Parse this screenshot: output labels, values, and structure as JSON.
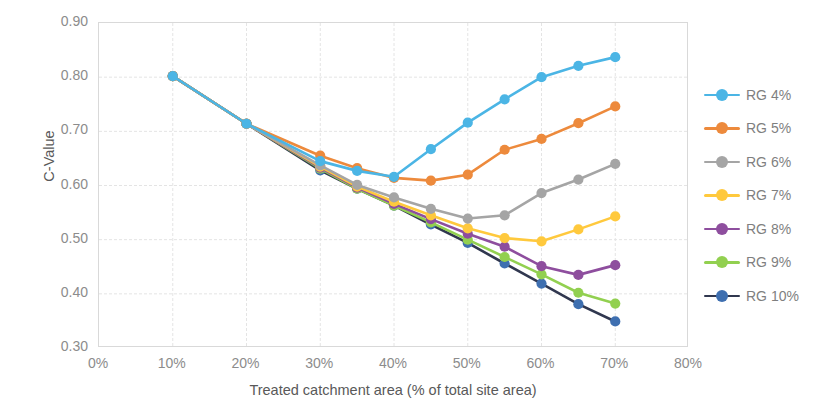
{
  "chart_data": {
    "type": "line",
    "title": "",
    "xlabel": "Treated catchment area (% of total site area)",
    "ylabel": "C-Value",
    "xlim": [
      0,
      80
    ],
    "ylim": [
      0.3,
      0.9
    ],
    "x_ticks": [
      "0%",
      "10%",
      "20%",
      "30%",
      "40%",
      "50%",
      "60%",
      "70%",
      "80%"
    ],
    "x_tick_values": [
      0,
      10,
      20,
      30,
      40,
      50,
      60,
      70,
      80
    ],
    "y_ticks": [
      "0.30",
      "0.40",
      "0.50",
      "0.60",
      "0.70",
      "0.80",
      "0.90"
    ],
    "y_tick_values": [
      0.3,
      0.4,
      0.5,
      0.6,
      0.7,
      0.8,
      0.9
    ],
    "grid": true,
    "legend_position": "right",
    "x": [
      10,
      20,
      30,
      35,
      40,
      45,
      50,
      55,
      60,
      65,
      70
    ],
    "series": [
      {
        "name": "RG 4%",
        "color": "#4BB5E5",
        "values": [
          0.802,
          0.714,
          0.645,
          0.627,
          0.616,
          0.667,
          0.716,
          0.759,
          0.8,
          0.821,
          0.837
        ]
      },
      {
        "name": "RG 5%",
        "color": "#ED8A3C",
        "values": [
          0.802,
          0.714,
          0.655,
          0.632,
          0.614,
          0.609,
          0.62,
          0.666,
          0.686,
          0.715,
          0.746
        ]
      },
      {
        "name": "RG 6%",
        "color": "#A5A5A5",
        "values": [
          0.802,
          0.714,
          0.637,
          0.601,
          0.578,
          0.557,
          0.539,
          0.545,
          0.586,
          0.611,
          0.64
        ]
      },
      {
        "name": "RG 7%",
        "color": "#FFC93D",
        "values": [
          0.802,
          0.714,
          0.635,
          0.598,
          0.57,
          0.545,
          0.521,
          0.503,
          0.497,
          0.519,
          0.543
        ]
      },
      {
        "name": "RG 8%",
        "color": "#8E4E9E",
        "values": [
          0.802,
          0.714,
          0.633,
          0.596,
          0.566,
          0.538,
          0.511,
          0.487,
          0.451,
          0.435,
          0.453
        ]
      },
      {
        "name": "RG 9%",
        "color": "#92D050",
        "values": [
          0.802,
          0.714,
          0.631,
          0.594,
          0.563,
          0.532,
          0.5,
          0.468,
          0.436,
          0.402,
          0.382
        ]
      },
      {
        "name": "RG 10%",
        "color": "#30374F",
        "marker_color": "#3E6FB0",
        "values": [
          0.802,
          0.714,
          0.628,
          0.594,
          0.563,
          0.528,
          0.494,
          0.456,
          0.419,
          0.381,
          0.349
        ]
      }
    ]
  },
  "legend": {
    "items": [
      {
        "label": "RG 4%"
      },
      {
        "label": "RG 5%"
      },
      {
        "label": "RG 6%"
      },
      {
        "label": "RG 7%"
      },
      {
        "label": "RG 8%"
      },
      {
        "label": "RG 9%"
      },
      {
        "label": "RG 10%"
      }
    ]
  }
}
